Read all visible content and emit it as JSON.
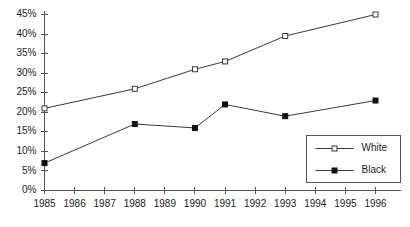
{
  "chart_data": {
    "type": "line",
    "title": "",
    "subtitle": "",
    "xlabel": "",
    "ylabel": "",
    "x": [
      1985,
      1986,
      1987,
      1988,
      1989,
      1990,
      1991,
      1992,
      1993,
      1994,
      1995,
      1996
    ],
    "xtick_labels": [
      "1985",
      "1986",
      "1987",
      "1988",
      "1989",
      "1990",
      "1991",
      "1992",
      "1993",
      "1994",
      "1995",
      "1996"
    ],
    "ytick_labels": [
      "0%",
      "5%",
      "10%",
      "15%",
      "20%",
      "25%",
      "30%",
      "35%",
      "40%",
      "45%"
    ],
    "ytick_values": [
      0,
      5,
      10,
      15,
      20,
      25,
      30,
      35,
      40,
      45
    ],
    "ylim": [
      0,
      45
    ],
    "xlim": [
      1985,
      1996
    ],
    "grid": false,
    "legend_position": "bottom-right",
    "series": [
      {
        "name": "White",
        "marker": "open-square",
        "color": "#3a3a3a",
        "x": [
          1985,
          1988,
          1990,
          1991,
          1993,
          1996
        ],
        "values": [
          21,
          26,
          31,
          33,
          39.5,
          45
        ]
      },
      {
        "name": "Black",
        "marker": "filled-square",
        "color": "#101010",
        "x": [
          1985,
          1988,
          1990,
          1991,
          1993,
          1996
        ],
        "values": [
          7,
          17,
          16,
          22,
          19,
          23
        ]
      }
    ]
  },
  "legend": {
    "items": [
      {
        "label": "White"
      },
      {
        "label": "Black"
      }
    ]
  }
}
